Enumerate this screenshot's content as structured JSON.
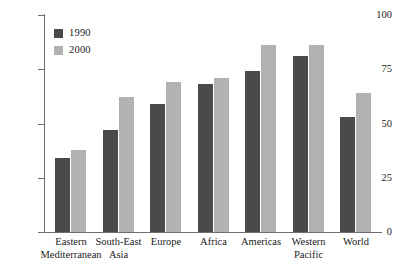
{
  "chart_data": {
    "type": "bar",
    "title": "",
    "subtitle": "",
    "xlabel": "",
    "ylabel": "",
    "ylim": [
      0,
      100
    ],
    "yticks": [
      0,
      25,
      50,
      75,
      100
    ],
    "grid": false,
    "legend_position": "top-left",
    "categories": [
      "Eastern Mediterranean",
      "South-East Asia",
      "Europe",
      "Africa",
      "Americas",
      "Western Pacific",
      "World"
    ],
    "category_lines": [
      [
        "Eastern",
        "Mediterranean"
      ],
      [
        "South-East",
        "Asia"
      ],
      [
        "Europe",
        ""
      ],
      [
        "Africa",
        ""
      ],
      [
        "Americas",
        ""
      ],
      [
        "Western",
        "Pacific"
      ],
      [
        "World",
        ""
      ]
    ],
    "series": [
      {
        "name": "1990",
        "color": "#4a4a4a",
        "values": [
          34,
          47,
          59,
          68,
          74,
          81,
          53
        ]
      },
      {
        "name": "2000",
        "color": "#b2b2b2",
        "values": [
          38,
          62,
          69,
          71,
          86,
          86,
          64
        ]
      }
    ]
  },
  "axis": {
    "y_tick_labels": [
      "0",
      "25",
      "50",
      "75",
      "100"
    ]
  },
  "legend": {
    "entries": [
      {
        "label": "1990",
        "swatch": "legend-swatch-1990"
      },
      {
        "label": "2000",
        "swatch": "legend-swatch-2000"
      }
    ]
  },
  "colors": {
    "series_1990": "#4a4a4a",
    "series_2000": "#b2b2b2",
    "axis": "#6e6e6e",
    "text": "#1a1a1a",
    "background": "#ffffff"
  }
}
